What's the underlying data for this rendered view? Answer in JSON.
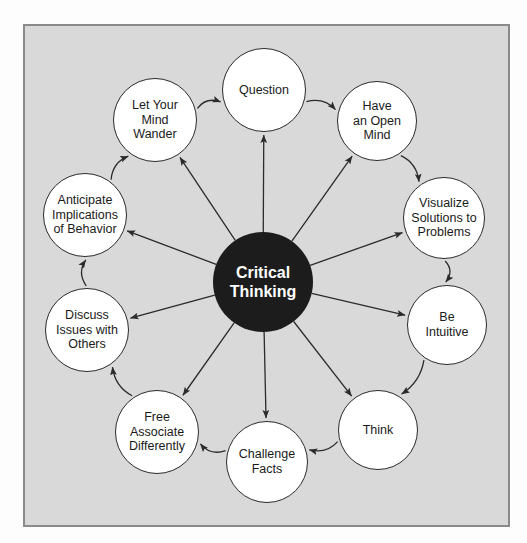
{
  "diagram": {
    "type": "radial-concept-map",
    "title": "Critical Thinking",
    "hub": {
      "label": "Critical\nThinking",
      "cx": 263,
      "cy": 282,
      "r": 50,
      "fill": "#1c1c1c",
      "text_color": "#ffffff"
    },
    "frame": {
      "background": "#d9d9d9",
      "border_color": "#8a8a8a"
    },
    "node_style": {
      "fill": "#ffffff",
      "border_color": "#2b2b2b",
      "text_color": "#1a1a1a"
    },
    "arrow_color": "#2b2b2b",
    "nodes": [
      {
        "id": "question",
        "label": "Question",
        "cx": 264,
        "cy": 90,
        "r": 42
      },
      {
        "id": "open-mind",
        "label": "Have\nan Open\nMind",
        "cx": 377,
        "cy": 121,
        "r": 40
      },
      {
        "id": "visualize",
        "label": "Visualize\nSolutions to\nProblems",
        "cx": 444,
        "cy": 218,
        "r": 41
      },
      {
        "id": "intuitive",
        "label": "Be\nIntuitive",
        "cx": 447,
        "cy": 325,
        "r": 40
      },
      {
        "id": "think",
        "label": "Think",
        "cx": 378,
        "cy": 430,
        "r": 40
      },
      {
        "id": "challenge",
        "label": "Challenge\nFacts",
        "cx": 267,
        "cy": 462,
        "r": 41
      },
      {
        "id": "free-assoc",
        "label": "Free\nAssociate\nDifferently",
        "cx": 157,
        "cy": 432,
        "r": 42
      },
      {
        "id": "discuss",
        "label": "Discuss\nIssues with\nOthers",
        "cx": 87,
        "cy": 330,
        "r": 42
      },
      {
        "id": "anticipate",
        "label": "Anticipate\nImplications\nof Behavior",
        "cx": 85,
        "cy": 215,
        "r": 42
      },
      {
        "id": "mind-wander",
        "label": "Let Your\nMind\nWander",
        "cx": 155,
        "cy": 120,
        "r": 42
      }
    ],
    "spoke_edges": [
      {
        "from": "hub",
        "to": "question"
      },
      {
        "from": "hub",
        "to": "open-mind"
      },
      {
        "from": "hub",
        "to": "visualize"
      },
      {
        "from": "hub",
        "to": "intuitive"
      },
      {
        "from": "hub",
        "to": "think"
      },
      {
        "from": "hub",
        "to": "challenge"
      },
      {
        "from": "hub",
        "to": "free-assoc"
      },
      {
        "from": "hub",
        "to": "discuss"
      },
      {
        "from": "hub",
        "to": "anticipate"
      },
      {
        "from": "hub",
        "to": "mind-wander"
      }
    ],
    "rim_edges": [
      {
        "from": "mind-wander",
        "to": "question"
      },
      {
        "from": "question",
        "to": "open-mind"
      },
      {
        "from": "open-mind",
        "to": "visualize"
      },
      {
        "from": "visualize",
        "to": "intuitive"
      },
      {
        "from": "intuitive",
        "to": "think"
      },
      {
        "from": "think",
        "to": "challenge"
      },
      {
        "from": "challenge",
        "to": "free-assoc"
      },
      {
        "from": "free-assoc",
        "to": "discuss"
      },
      {
        "from": "discuss",
        "to": "anticipate"
      },
      {
        "from": "anticipate",
        "to": "mind-wander"
      }
    ]
  }
}
